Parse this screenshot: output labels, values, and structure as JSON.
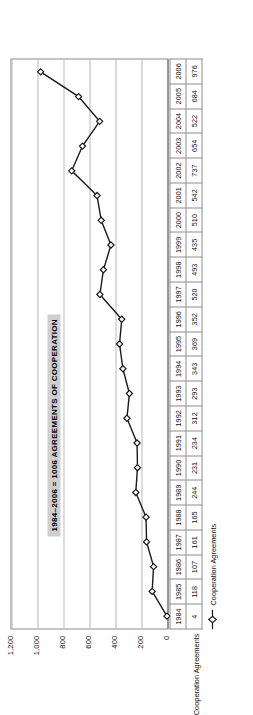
{
  "chart_data": {
    "type": "line",
    "title": "1984–2006 = 1006 AGREEMENTS OF COOPERATION",
    "xlabel": "",
    "ylabel": "",
    "ylim": [
      0,
      1200
    ],
    "yticks": [
      "0",
      "200",
      "400",
      "600",
      "800",
      "1,000",
      "1,200"
    ],
    "ytick_values": [
      0,
      200,
      400,
      600,
      800,
      1000,
      1200
    ],
    "grid": true,
    "legend_position": "bottom-left",
    "categories": [
      "1984",
      "1985",
      "1986",
      "1987",
      "1988",
      "1989",
      "1990",
      "1991",
      "1992",
      "1993",
      "1994",
      "1995",
      "1996",
      "1997",
      "1998",
      "1999",
      "2000",
      "2001",
      "2002",
      "2003",
      "2004",
      "2005",
      "2006"
    ],
    "series": [
      {
        "name": "Cooperation Agreements",
        "marker": "diamond",
        "color": "#1a1a1a",
        "values": [
          4,
          118,
          107,
          161,
          165,
          244,
          231,
          234,
          312,
          293,
          343,
          369,
          352,
          520,
          493,
          435,
          510,
          542,
          737,
          654,
          522,
          684,
          976
        ]
      }
    ],
    "data_table": {
      "row_label": "Cooperation Agreements",
      "years": [
        "1984",
        "1985",
        "1986",
        "1987",
        "1988",
        "1989",
        "1990",
        "1991",
        "1992",
        "1993",
        "1994",
        "1995",
        "1996",
        "1997",
        "1998",
        "1999",
        "2000",
        "2001",
        "2002",
        "2003",
        "2004",
        "2005",
        "2006"
      ],
      "values": [
        "4",
        "118",
        "107",
        "161",
        "165",
        "244",
        "231",
        "234",
        "312",
        "293",
        "343",
        "369",
        "352",
        "520",
        "493",
        "435",
        "510",
        "542",
        "737",
        "654",
        "522",
        "684",
        "976"
      ]
    }
  },
  "legend": {
    "entries": [
      {
        "label": "Cooperation Agreements",
        "marker": "diamond-line-marker"
      }
    ]
  },
  "colors": {
    "series": "#1a1a1a",
    "title_background": "#cfcfcf",
    "grid": "#b9b9b9",
    "axis": "#6a6a6a",
    "table_border": "#8d8d8d",
    "text": "#111111"
  }
}
